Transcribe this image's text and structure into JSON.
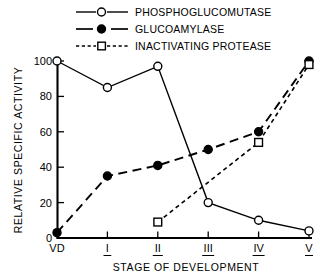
{
  "chart_data": {
    "type": "line",
    "title": "",
    "xlabel": "STAGE OF DEVELOPMENT",
    "ylabel": "RELATIVE SPECIFIC ACTIVITY",
    "categories": [
      "VD",
      "I",
      "II",
      "III",
      "IV",
      "V"
    ],
    "ylim": [
      0,
      100
    ],
    "yticks": [
      0,
      20,
      40,
      60,
      80,
      100
    ],
    "ytick_labels": [
      "0",
      "20",
      "40",
      "60",
      "80",
      "100"
    ],
    "grid": false,
    "legend_position": "top",
    "series": [
      {
        "name": "PHOSPHOGLUCOMUTASE",
        "marker": "open-circle",
        "linestyle": "solid",
        "color": "#000000",
        "x": [
          "VD",
          "I",
          "II",
          "III",
          "IV",
          "V"
        ],
        "values": [
          100,
          85,
          97,
          20,
          10,
          4
        ]
      },
      {
        "name": "GLUCOAMYLASE",
        "marker": "filled-circle",
        "linestyle": "dashed",
        "color": "#000000",
        "x": [
          "VD",
          "I",
          "II",
          "III",
          "IV",
          "V"
        ],
        "values": [
          3,
          35,
          41,
          50,
          60,
          100
        ]
      },
      {
        "name": "INACTIVATING PROTEASE",
        "marker": "open-square",
        "linestyle": "dotted",
        "color": "#000000",
        "x": [
          "II",
          "IV",
          "V"
        ],
        "values": [
          9,
          54,
          98
        ]
      }
    ]
  },
  "legend": {
    "items": [
      {
        "label": "PHOSPHOGLUCOMUTASE"
      },
      {
        "label": "GLUCOAMYLASE"
      },
      {
        "label": "INACTIVATING PROTEASE"
      }
    ]
  },
  "axes": {
    "y_title": "RELATIVE SPECIFIC ACTIVITY",
    "x_title": "STAGE OF DEVELOPMENT",
    "y_tick_labels": [
      "100",
      "80",
      "60",
      "40",
      "20",
      "0"
    ],
    "x_tick_labels": [
      "VD",
      "I",
      "II",
      "III",
      "IV",
      "V"
    ]
  }
}
